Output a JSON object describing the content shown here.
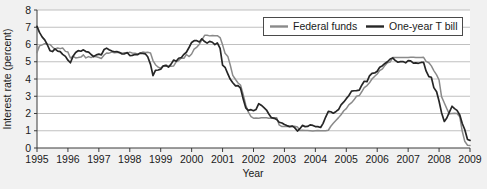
{
  "chart_data": {
    "type": "line",
    "title": "",
    "xlabel": "Year",
    "ylabel": "Interest rate (percent)",
    "xlim": [
      1995,
      2009
    ],
    "ylim": [
      0,
      8
    ],
    "grid": true,
    "legend_position": "top-right",
    "y_ticks": [
      "0",
      "1",
      "2",
      "3",
      "4",
      "5",
      "6",
      "7",
      "8"
    ],
    "x_ticks": [
      "1995",
      "1996",
      "1997",
      "1998",
      "1999",
      "2000",
      "2001",
      "2002",
      "2003",
      "2004",
      "2005",
      "2006",
      "2007",
      "2008",
      "2009"
    ],
    "colors": {
      "federal_funds": "#8a8a8a",
      "one_year_t_bill": "#262626",
      "grid": "#b9b9b9",
      "axis": "#3a3a3a",
      "plot_bg": "#ffffff",
      "figure_bg": "#f1f1f1"
    },
    "series": [
      {
        "name": "Federal funds",
        "color": "#8a8a8a",
        "x": [
          1995.0,
          1995.08,
          1995.17,
          1995.25,
          1995.33,
          1995.42,
          1995.5,
          1995.58,
          1995.67,
          1995.75,
          1995.83,
          1995.92,
          1996.0,
          1996.08,
          1996.17,
          1996.25,
          1996.33,
          1996.42,
          1996.5,
          1996.58,
          1996.67,
          1996.75,
          1996.83,
          1996.92,
          1997.0,
          1997.08,
          1997.17,
          1997.25,
          1997.33,
          1997.42,
          1997.5,
          1997.58,
          1997.67,
          1997.75,
          1997.83,
          1997.92,
          1998.0,
          1998.08,
          1998.17,
          1998.25,
          1998.33,
          1998.42,
          1998.5,
          1998.58,
          1998.67,
          1998.75,
          1998.83,
          1998.92,
          1999.0,
          1999.08,
          1999.17,
          1999.25,
          1999.33,
          1999.42,
          1999.5,
          1999.58,
          1999.67,
          1999.75,
          1999.83,
          1999.92,
          2000.0,
          2000.08,
          2000.17,
          2000.25,
          2000.33,
          2000.42,
          2000.5,
          2000.58,
          2000.67,
          2000.75,
          2000.83,
          2000.92,
          2001.0,
          2001.08,
          2001.17,
          2001.25,
          2001.33,
          2001.42,
          2001.5,
          2001.58,
          2001.67,
          2001.75,
          2001.83,
          2001.92,
          2002.0,
          2002.08,
          2002.17,
          2002.25,
          2002.33,
          2002.42,
          2002.5,
          2002.58,
          2002.67,
          2002.75,
          2002.83,
          2002.92,
          2003.0,
          2003.08,
          2003.17,
          2003.25,
          2003.33,
          2003.42,
          2003.5,
          2003.58,
          2003.67,
          2003.75,
          2003.83,
          2003.92,
          2004.0,
          2004.08,
          2004.17,
          2004.25,
          2004.33,
          2004.42,
          2004.5,
          2004.58,
          2004.67,
          2004.75,
          2004.83,
          2004.92,
          2005.0,
          2005.08,
          2005.17,
          2005.25,
          2005.33,
          2005.42,
          2005.5,
          2005.58,
          2005.67,
          2005.75,
          2005.83,
          2005.92,
          2006.0,
          2006.08,
          2006.17,
          2006.25,
          2006.33,
          2006.42,
          2006.5,
          2006.58,
          2006.67,
          2006.75,
          2006.83,
          2006.92,
          2007.0,
          2007.08,
          2007.17,
          2007.25,
          2007.33,
          2007.42,
          2007.5,
          2007.58,
          2007.67,
          2007.75,
          2007.83,
          2007.92,
          2008.0,
          2008.08,
          2008.17,
          2008.25,
          2008.33,
          2008.42,
          2008.5,
          2008.58,
          2008.67,
          2008.75,
          2008.83,
          2008.92,
          2009.0
        ],
        "values": [
          5.53,
          5.92,
          5.98,
          6.05,
          6.01,
          6.0,
          5.85,
          5.74,
          5.8,
          5.76,
          5.8,
          5.6,
          5.56,
          5.22,
          5.31,
          5.22,
          5.24,
          5.27,
          5.4,
          5.22,
          5.3,
          5.24,
          5.31,
          5.29,
          5.25,
          5.19,
          5.39,
          5.51,
          5.5,
          5.56,
          5.52,
          5.54,
          5.54,
          5.5,
          5.52,
          5.5,
          5.56,
          5.51,
          5.49,
          5.45,
          5.49,
          5.56,
          5.54,
          5.55,
          5.51,
          5.07,
          4.83,
          4.68,
          4.63,
          4.76,
          4.81,
          4.74,
          4.74,
          4.76,
          4.99,
          5.07,
          5.22,
          5.2,
          5.42,
          5.3,
          5.45,
          5.73,
          5.85,
          6.02,
          6.27,
          6.53,
          6.54,
          6.5,
          6.52,
          6.51,
          6.51,
          6.4,
          5.98,
          5.49,
          5.31,
          4.8,
          4.21,
          3.97,
          3.77,
          3.65,
          3.07,
          2.49,
          2.09,
          1.82,
          1.73,
          1.74,
          1.73,
          1.75,
          1.75,
          1.75,
          1.73,
          1.74,
          1.75,
          1.75,
          1.34,
          1.24,
          1.24,
          1.26,
          1.25,
          1.26,
          1.26,
          1.22,
          1.01,
          1.03,
          1.01,
          1.01,
          1.0,
          0.98,
          1.0,
          1.01,
          1.0,
          1.0,
          1.0,
          1.03,
          1.26,
          1.43,
          1.61,
          1.76,
          1.93,
          2.16,
          2.28,
          2.5,
          2.63,
          2.79,
          3.0,
          3.04,
          3.26,
          3.5,
          3.62,
          3.78,
          4.0,
          4.16,
          4.29,
          4.49,
          4.59,
          4.79,
          4.94,
          4.99,
          5.24,
          5.25,
          5.25,
          5.25,
          5.25,
          5.24,
          5.25,
          5.26,
          5.26,
          5.25,
          5.25,
          5.25,
          5.26,
          5.02,
          4.94,
          4.76,
          4.49,
          4.24,
          3.94,
          2.98,
          2.61,
          2.28,
          1.98,
          2.0,
          2.01,
          2.0,
          1.81,
          0.97,
          0.39,
          0.16,
          0.15
        ]
      },
      {
        "name": "One-year T bill",
        "color": "#262626",
        "x": [
          1995.0,
          1995.08,
          1995.17,
          1995.25,
          1995.33,
          1995.42,
          1995.5,
          1995.58,
          1995.67,
          1995.75,
          1995.83,
          1995.92,
          1996.0,
          1996.08,
          1996.17,
          1996.25,
          1996.33,
          1996.42,
          1996.5,
          1996.58,
          1996.67,
          1996.75,
          1996.83,
          1996.92,
          1997.0,
          1997.08,
          1997.17,
          1997.25,
          1997.33,
          1997.42,
          1997.5,
          1997.58,
          1997.67,
          1997.75,
          1997.83,
          1997.92,
          1998.0,
          1998.08,
          1998.17,
          1998.25,
          1998.33,
          1998.42,
          1998.5,
          1998.58,
          1998.67,
          1998.75,
          1998.83,
          1998.92,
          1999.0,
          1999.08,
          1999.17,
          1999.25,
          1999.33,
          1999.42,
          1999.5,
          1999.58,
          1999.67,
          1999.75,
          1999.83,
          1999.92,
          2000.0,
          2000.08,
          2000.17,
          2000.25,
          2000.33,
          2000.42,
          2000.5,
          2000.58,
          2000.67,
          2000.75,
          2000.83,
          2000.92,
          2001.0,
          2001.08,
          2001.17,
          2001.25,
          2001.33,
          2001.42,
          2001.5,
          2001.58,
          2001.67,
          2001.75,
          2001.83,
          2001.92,
          2002.0,
          2002.08,
          2002.17,
          2002.25,
          2002.33,
          2002.42,
          2002.5,
          2002.58,
          2002.67,
          2002.75,
          2002.83,
          2002.92,
          2003.0,
          2003.08,
          2003.17,
          2003.25,
          2003.33,
          2003.42,
          2003.5,
          2003.58,
          2003.67,
          2003.75,
          2003.83,
          2003.92,
          2004.0,
          2004.08,
          2004.17,
          2004.25,
          2004.33,
          2004.42,
          2004.5,
          2004.58,
          2004.67,
          2004.75,
          2004.83,
          2004.92,
          2005.0,
          2005.08,
          2005.17,
          2005.25,
          2005.33,
          2005.42,
          2005.5,
          2005.58,
          2005.67,
          2005.75,
          2005.83,
          2005.92,
          2006.0,
          2006.08,
          2006.17,
          2006.25,
          2006.33,
          2006.42,
          2006.5,
          2006.58,
          2006.67,
          2006.75,
          2006.83,
          2006.92,
          2007.0,
          2007.08,
          2007.17,
          2007.25,
          2007.33,
          2007.42,
          2007.5,
          2007.58,
          2007.67,
          2007.75,
          2007.83,
          2007.92,
          2008.0,
          2008.08,
          2008.17,
          2008.25,
          2008.33,
          2008.42,
          2008.5,
          2008.58,
          2008.67,
          2008.75,
          2008.83,
          2008.92,
          2009.0
        ],
        "values": [
          7.05,
          6.7,
          6.43,
          6.27,
          6.0,
          5.64,
          5.59,
          5.75,
          5.62,
          5.59,
          5.43,
          5.31,
          5.09,
          4.94,
          5.34,
          5.54,
          5.64,
          5.61,
          5.69,
          5.59,
          5.56,
          5.42,
          5.3,
          5.4,
          5.44,
          5.4,
          5.71,
          5.79,
          5.7,
          5.62,
          5.58,
          5.59,
          5.53,
          5.45,
          5.46,
          5.53,
          5.36,
          5.37,
          5.42,
          5.41,
          5.5,
          5.48,
          5.46,
          5.29,
          4.85,
          4.2,
          4.5,
          4.52,
          4.57,
          4.76,
          4.78,
          4.69,
          4.85,
          5.1,
          5.03,
          5.2,
          5.25,
          5.43,
          5.55,
          5.84,
          6.12,
          6.22,
          6.22,
          6.15,
          6.33,
          6.17,
          6.08,
          6.18,
          6.13,
          5.99,
          6.09,
          5.77,
          4.81,
          4.68,
          4.3,
          3.98,
          3.78,
          3.6,
          3.62,
          3.47,
          2.82,
          2.33,
          2.18,
          2.22,
          2.16,
          2.23,
          2.57,
          2.48,
          2.35,
          2.2,
          1.96,
          1.76,
          1.72,
          1.65,
          1.49,
          1.45,
          1.36,
          1.3,
          1.24,
          1.27,
          1.18,
          0.98,
          1.12,
          1.31,
          1.24,
          1.25,
          1.34,
          1.31,
          1.24,
          1.24,
          1.19,
          1.43,
          1.78,
          2.12,
          2.1,
          2.02,
          2.12,
          2.23,
          2.5,
          2.67,
          2.86,
          3.03,
          3.3,
          3.32,
          3.33,
          3.36,
          3.64,
          3.87,
          3.85,
          4.18,
          4.33,
          4.35,
          4.45,
          4.68,
          4.77,
          4.9,
          5.0,
          5.16,
          5.22,
          5.08,
          4.97,
          5.01,
          5.01,
          4.94,
          5.06,
          5.05,
          4.92,
          4.93,
          4.91,
          4.96,
          4.96,
          4.47,
          4.14,
          4.1,
          3.5,
          3.26,
          2.71,
          2.05,
          1.54,
          1.74,
          2.06,
          2.42,
          2.28,
          2.18,
          1.91,
          1.42,
          1.07,
          0.49,
          0.44
        ]
      }
    ]
  },
  "legend": {
    "items": [
      {
        "label": "Federal funds",
        "color": "#8a8a8a"
      },
      {
        "label": "One-year T bill",
        "color": "#262626"
      }
    ]
  },
  "axes": {
    "y_label": "Interest rate (percent)",
    "x_label": "Year"
  }
}
